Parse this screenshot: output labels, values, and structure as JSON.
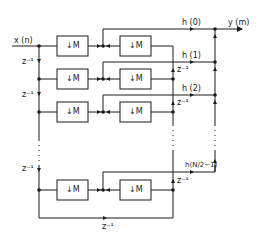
{
  "diagram": {
    "input_label": "x (n)",
    "output_label": "y (m)",
    "delay_label": "z⁻¹",
    "downsample_label": "↓M",
    "coefficients": [
      "h (0)",
      "h (1)",
      "h (2)",
      "h(N/2−1)"
    ],
    "left_delays": [
      "z⁻¹",
      "z⁻¹",
      "z⁻¹"
    ],
    "right_delays": [
      "z⁻¹",
      "z⁻¹",
      "z⁻¹"
    ],
    "bottom_delay": "z⁻¹",
    "colors": {
      "line": "#1a1a1a",
      "background": "#ffffff"
    }
  }
}
